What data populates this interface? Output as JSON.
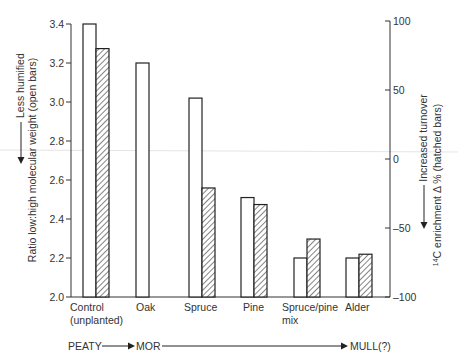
{
  "chart_data": {
    "type": "bar",
    "title": "",
    "categories": [
      "Control (unplanted)",
      "Oak",
      "Spruce",
      "Pine",
      "Spruce/pine mix",
      "Alder"
    ],
    "category_lines": [
      [
        "Control",
        "(unplanted)"
      ],
      [
        "Oak"
      ],
      [
        "Spruce"
      ],
      [
        "Pine"
      ],
      [
        "Spruce/pine",
        "mix"
      ],
      [
        "Alder"
      ]
    ],
    "series": [
      {
        "name": "Ratio low:high molecular weight (open bars)",
        "style": "open",
        "axis": "left",
        "values": [
          3.4,
          3.2,
          3.02,
          2.51,
          2.2,
          2.2
        ]
      },
      {
        "name": "14C enrichment Δ % (hatched bars)",
        "style": "hatched",
        "axis": "right",
        "values": [
          80,
          null,
          -21,
          -33,
          -58,
          -69
        ]
      }
    ],
    "left_axis": {
      "label": "Ratio low:high molecular weight (open bars)",
      "annotation": "Less humified",
      "ylim": [
        2.0,
        3.4
      ],
      "ticks": [
        "2.0",
        "2.2",
        "2.4",
        "2.6",
        "2.8",
        "3.0",
        "3.2",
        "3.4"
      ]
    },
    "right_axis": {
      "label": "14C enrichment Δ % (hatched bars)",
      "label_prefix_superscript": "14",
      "label_main": "C enrichment Δ % (hatched bars)",
      "annotation": "Increased turnover",
      "ylim": [
        -100,
        100
      ],
      "ticks": [
        "100",
        "50",
        "0",
        "−50",
        "−100"
      ]
    },
    "xlabel": "",
    "grid": false,
    "legend": "none (described in axis labels)"
  },
  "flow": {
    "labels": [
      "PEATY",
      "MOR",
      "MULL(?)"
    ]
  }
}
